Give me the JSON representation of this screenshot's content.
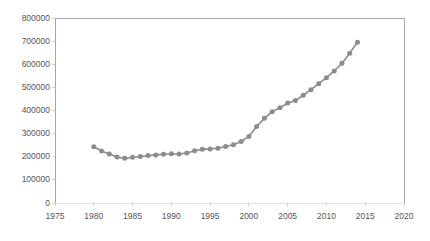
{
  "chart_data": {
    "type": "line",
    "title": "",
    "subtitle": "",
    "xlabel": "",
    "ylabel": "",
    "xlim": [
      1975,
      2020
    ],
    "ylim": [
      0,
      800000
    ],
    "grid": false,
    "legend": null,
    "legend_position": "none",
    "marker": "circle",
    "series_color": "#8c8c8c",
    "axis_color": "#a6a6a6",
    "text_color": "#595959",
    "x_ticks": [
      1975,
      1980,
      1985,
      1990,
      1995,
      2000,
      2005,
      2010,
      2015,
      2020
    ],
    "x_tick_labels": [
      "1975",
      "1980",
      "1985",
      "1990",
      "1995",
      "2000",
      "2005",
      "2010",
      "2015",
      "2020"
    ],
    "y_ticks": [
      0,
      100000,
      200000,
      300000,
      400000,
      500000,
      600000,
      700000,
      800000
    ],
    "y_tick_labels": [
      "0",
      "100000",
      "200000",
      "300000",
      "400000",
      "500000",
      "600000",
      "700000",
      "800000"
    ],
    "series": [
      {
        "name": "series-1",
        "x": [
          1980,
          1981,
          1982,
          1983,
          1984,
          1985,
          1986,
          1987,
          1988,
          1989,
          1990,
          1991,
          1992,
          1993,
          1994,
          1995,
          1996,
          1997,
          1998,
          1999,
          2000,
          2001,
          2002,
          2003,
          2004,
          2005,
          2006,
          2007,
          2008,
          2009,
          2010,
          2011,
          2012,
          2013,
          2014
        ],
        "values": [
          243000,
          225000,
          212000,
          199000,
          193000,
          198000,
          201000,
          205000,
          208000,
          211000,
          213000,
          212000,
          216000,
          226000,
          232000,
          234000,
          237000,
          244000,
          252000,
          266000,
          288000,
          331000,
          366000,
          395000,
          412000,
          432000,
          443000,
          466000,
          490000,
          516000,
          542000,
          571000,
          604000,
          648000,
          695000
        ]
      }
    ]
  }
}
